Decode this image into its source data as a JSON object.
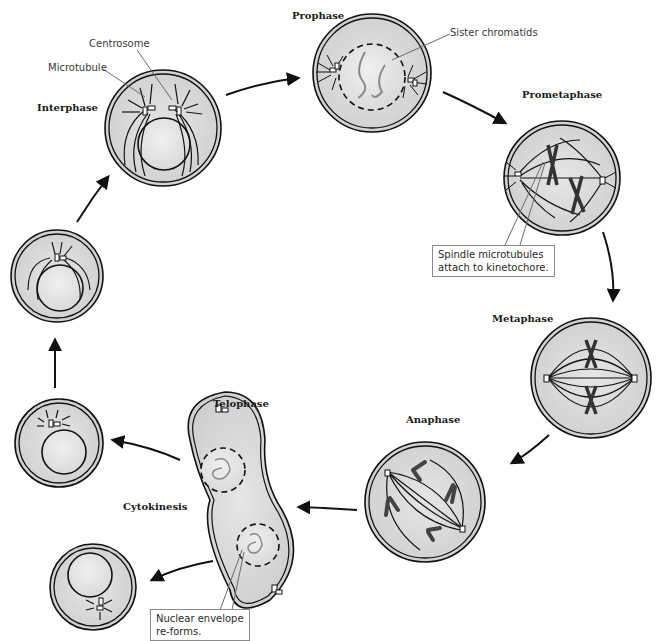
{
  "colors": {
    "cytoplasm": "#d9d9d9",
    "nucleus": "#e8e8e8",
    "outline": "#111111",
    "leader": "#6a6a6a",
    "callout_border": "#8a8a8a"
  },
  "phases": [
    {
      "id": "interphase",
      "label": "Interphase"
    },
    {
      "id": "prophase",
      "label": "Prophase"
    },
    {
      "id": "prometaphase",
      "label": "Prometaphase"
    },
    {
      "id": "metaphase",
      "label": "Metaphase"
    },
    {
      "id": "anaphase",
      "label": "Anaphase"
    },
    {
      "id": "telophase",
      "label": "Telophase"
    },
    {
      "id": "cytokinesis",
      "label": "Cytokinesis"
    }
  ],
  "callouts": {
    "centrosome": "Centrosome",
    "microtubule": "Microtubule",
    "sister_chromatids": "Sister chromatids",
    "spindle_line1": "Spindle microtubules",
    "spindle_line2": "attach to kinetochore.",
    "nuclear_line1": "Nuclear envelope",
    "nuclear_line2": "re-forms."
  }
}
